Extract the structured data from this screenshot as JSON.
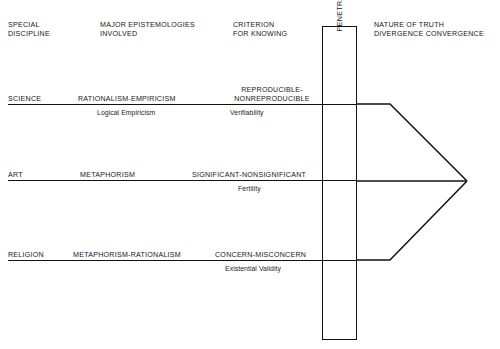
{
  "diagram": {
    "title_implicit": "Epistemologies and the Penetrable Barrier",
    "headers": [
      {
        "id": "special-discipline",
        "line1": "SPECIAL",
        "line2": "DISCIPLINE"
      },
      {
        "id": "major-epistemologies",
        "line1": "MAJOR EPISTEMOLOGIES",
        "line2": "INVOLVED"
      },
      {
        "id": "criterion-for-knowing",
        "line1": "CRITERION",
        "line2": "FOR KNOWING"
      },
      {
        "id": "nature-of-truth",
        "line1": "NATURE OF TRUTH",
        "line2": "DIVERGENCE CONVERGENCE"
      }
    ],
    "rows": [
      {
        "id": "science",
        "discipline": "SCIENCE",
        "epistemology": "RATIONALISM-EMPIRICISM",
        "criterion_line1": "REPRODUCIBLE-",
        "criterion_line2": "NONREPRODUCIBLE",
        "epistemology_sub": "Logical Empiricism",
        "criterion_sub": "Verifiability"
      },
      {
        "id": "art",
        "discipline": "ART",
        "epistemology": "METAPHORISM",
        "criterion_line1": "",
        "criterion_line2": "SIGNIFICANT-NONSIGNIFICANT",
        "epistemology_sub": "",
        "criterion_sub": "Fertility"
      },
      {
        "id": "religion",
        "discipline": "RELIGION",
        "epistemology": "METAPHORISM-RATIONALISM",
        "criterion_line1": "",
        "criterion_line2": "CONCERN-MISCONCERN",
        "epistemology_sub": "",
        "criterion_sub": "Existential Validity"
      }
    ],
    "barrier": {
      "label": "PENETRABLE BARRIER BETWEEN THE KNOWN AND THE UNKNOWN"
    },
    "colors": {
      "ink": "#111111",
      "paper": "#ffffff"
    }
  }
}
